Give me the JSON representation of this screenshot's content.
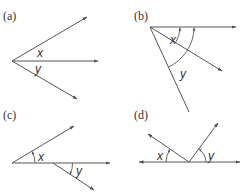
{
  "figure": {
    "panels": [
      {
        "id": "a",
        "label": "(a)",
        "angle_labels": [
          "x",
          "y"
        ]
      },
      {
        "id": "b",
        "label": "(b)",
        "angle_labels": [
          "x",
          "y"
        ]
      },
      {
        "id": "c",
        "label": "(c)",
        "angle_labels": [
          "x",
          "y"
        ]
      },
      {
        "id": "d",
        "label": "(d)",
        "angle_labels": [
          "x",
          "y"
        ]
      }
    ]
  },
  "colors": {
    "line": "#555555",
    "text": "#333333",
    "background": "#ffffff"
  }
}
